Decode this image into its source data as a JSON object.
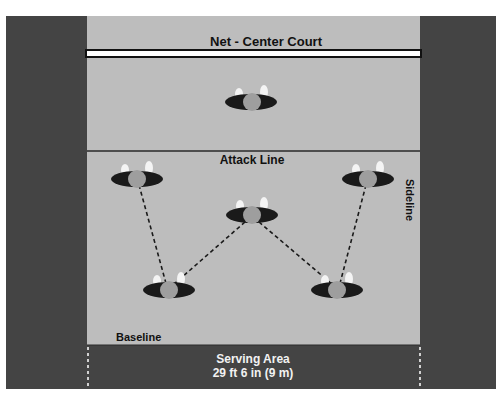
{
  "diagram": {
    "type": "volleyball-court-serve-receive-formation",
    "labels": {
      "net": "Net - Center Court",
      "attack_line": "Attack Line",
      "sideline": "Sideline",
      "baseline": "Baseline",
      "serving_area_title": "Serving Area",
      "serving_area_size": "29 ft 6 in (9 m)"
    },
    "colors": {
      "court": "#bdbdbd",
      "outer": "#444444",
      "net": "#ffffff",
      "line": "#2a2a2a",
      "player_shadow": "#1a1a1a",
      "player_body": "#9e9e9e",
      "player_hands": "#f4f4f4",
      "serving_text": "#f2f2f2"
    },
    "players": [
      {
        "id": "front-center",
        "x": 251,
        "y": 102
      },
      {
        "id": "left-wing",
        "x": 137,
        "y": 179
      },
      {
        "id": "right-wing",
        "x": 368,
        "y": 179
      },
      {
        "id": "middle",
        "x": 252,
        "y": 215
      },
      {
        "id": "back-left",
        "x": 169,
        "y": 290
      },
      {
        "id": "back-right",
        "x": 337,
        "y": 290
      }
    ],
    "passing_paths": [
      {
        "from": "left-wing",
        "to": "back-left"
      },
      {
        "from": "middle",
        "to": "back-left"
      },
      {
        "from": "middle",
        "to": "back-right"
      },
      {
        "from": "right-wing",
        "to": "back-right"
      }
    ]
  }
}
